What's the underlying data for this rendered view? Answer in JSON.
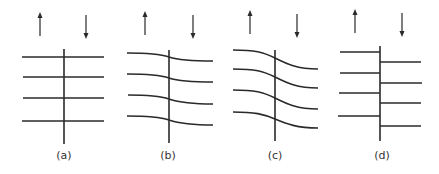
{
  "figure": {
    "panels": [
      {
        "id": "a",
        "label": "(a)",
        "type": "straight-continuous",
        "arrows": {
          "up_x": 40,
          "down_x": 86
        }
      },
      {
        "id": "b",
        "label": "(b)",
        "type": "slight-drag",
        "arrows": {
          "up_x": 145,
          "down_x": 193
        }
      },
      {
        "id": "c",
        "label": "(c)",
        "type": "strong-drag",
        "arrows": {
          "up_x": 250,
          "down_x": 297
        }
      },
      {
        "id": "d",
        "label": "(d)",
        "type": "offset-discontinuous",
        "arrows": {
          "up_x": 355,
          "down_x": 402
        }
      }
    ]
  },
  "colors": {
    "line": "#2a2a2a",
    "background": "#ffffff",
    "label": "#333333"
  }
}
